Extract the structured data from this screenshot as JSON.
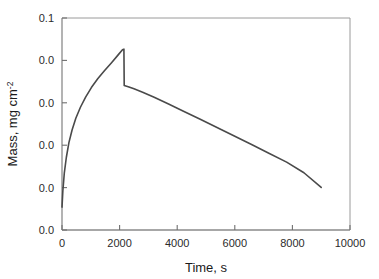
{
  "chart_data": {
    "type": "line",
    "title": "",
    "subtitle": "",
    "xlabel": "Time, s",
    "ylabel": "Mass, mg cm",
    "ylabel_superscript": "-2",
    "xlim": [
      0,
      10000
    ],
    "ylim": [
      0,
      0.1
    ],
    "grid": false,
    "legend": null,
    "xticks": [
      0,
      2000,
      4000,
      6000,
      8000,
      10000
    ],
    "xtick_labels": [
      "0",
      "2000",
      "4000",
      "6000",
      "8000",
      "10000"
    ],
    "yticks": [
      0.0,
      0.02,
      0.04,
      0.06,
      0.08,
      0.1
    ],
    "ytick_labels": [
      "0.0",
      "0.0",
      "0.0",
      "0.0",
      "0.0",
      "0.1"
    ],
    "line_color": "#4a4a4a",
    "line_width": 1.6,
    "series": [
      {
        "name": "mass change",
        "x": [
          0,
          30,
          80,
          150,
          240,
          350,
          480,
          640,
          820,
          1020,
          1240,
          1480,
          1720,
          1950,
          2100,
          2150,
          2160,
          2300,
          2500,
          2800,
          3200,
          3700,
          4200,
          4800,
          5400,
          6000,
          6600,
          7200,
          7800,
          8400,
          9000
        ],
        "y": [
          0.0108,
          0.0185,
          0.0268,
          0.0342,
          0.0412,
          0.0472,
          0.0527,
          0.0579,
          0.0627,
          0.0672,
          0.0713,
          0.0752,
          0.0789,
          0.0826,
          0.085,
          0.0853,
          0.0682,
          0.0676,
          0.0666,
          0.065,
          0.0626,
          0.0594,
          0.0561,
          0.0522,
          0.0482,
          0.0442,
          0.0402,
          0.0361,
          0.032,
          0.027,
          0.0201
        ]
      }
    ],
    "annotations": [
      {
        "kind": "peak",
        "x": 2150,
        "y": 0.0853
      },
      {
        "kind": "discontinuity-drop",
        "x": 2155,
        "y_from": 0.0853,
        "y_to": 0.0682
      },
      {
        "kind": "series-end",
        "x": 9000,
        "y": 0.0201
      }
    ]
  },
  "axes": {
    "x_title": "Time, s",
    "y_title_main": "Mass, mg cm",
    "y_title_sup": "-2"
  },
  "style": {
    "frame_color": "#9a9a9a",
    "tick_color": "#6f6f6f",
    "text_color": "#2b2b2b",
    "background": "#ffffff"
  }
}
